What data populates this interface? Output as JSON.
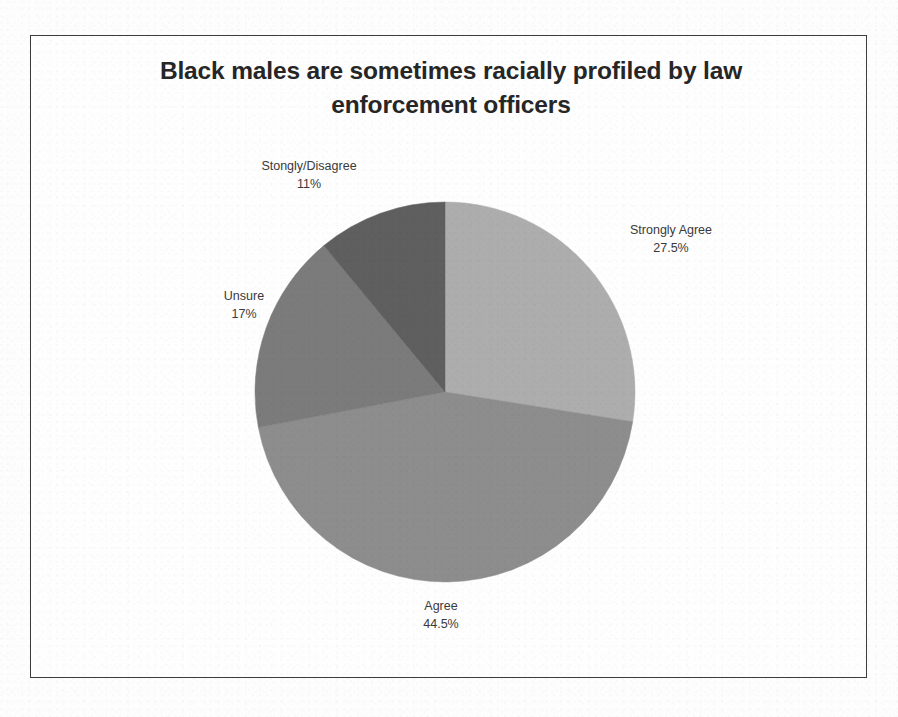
{
  "chart_data": {
    "type": "pie",
    "title": "Black males are sometimes racially profiled by law enforcement officers",
    "categories": [
      "Strongly Agree",
      "Agree",
      "Unsure",
      "Stongly/Disagree"
    ],
    "values": [
      27.5,
      44.5,
      17,
      11
    ],
    "value_labels": [
      "27.5%",
      "44.5%",
      "17%",
      "11%"
    ],
    "units": "percent",
    "start_angle_deg": 0,
    "direction": "clockwise",
    "legend": "none",
    "labels_position": "outside",
    "colors": [
      "#adadad",
      "#8d8d8d",
      "#7b7b7b",
      "#5f5f5f"
    ],
    "slices": [
      {
        "name": "Strongly Agree",
        "value": 27.5,
        "value_label": "27.5%",
        "color": "#adadad"
      },
      {
        "name": "Agree",
        "value": 44.5,
        "value_label": "44.5%",
        "color": "#8d8d8d"
      },
      {
        "name": "Unsure",
        "value": 17,
        "value_label": "17%",
        "color": "#7b7b7b"
      },
      {
        "name": "Stongly/Disagree",
        "value": 11,
        "value_label": "11%",
        "color": "#5f5f5f"
      }
    ]
  },
  "frame": {
    "border_color": "#3c3c3c",
    "background": "#fefefe"
  }
}
